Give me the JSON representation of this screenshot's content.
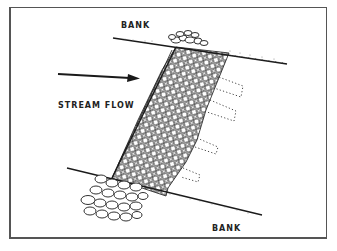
{
  "diagram": {
    "labels": {
      "bank_top": "BANK",
      "bank_bottom": "BANK",
      "stream_flow": "STREAM FLOW"
    },
    "elements": [
      "upper-bank-line",
      "lower-bank-line",
      "stream-flow-arrow",
      "gabion-wire-mesh-structure",
      "top-rock-pile",
      "toe-rock-pile",
      "dotted-anchor-outlines"
    ],
    "colors": {
      "ink": "#1a1a1a",
      "background": "#ffffff",
      "frame": "#555555"
    }
  }
}
